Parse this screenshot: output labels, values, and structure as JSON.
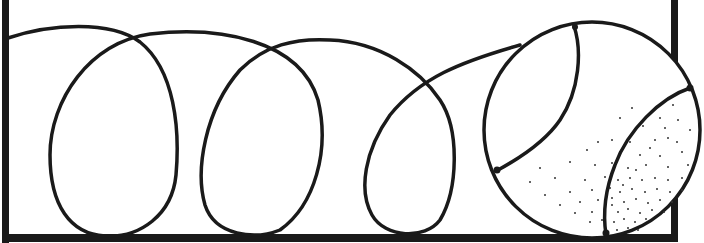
{
  "figure": {
    "description": "Line drawing of a looping line forming three loops that ends at a circle containing a curved seam and a stippled region, enclosed by a bracket-like frame",
    "colors": {
      "stroke": "#1a1a1a",
      "background": "#ffffff",
      "stipple": "#333333"
    },
    "elements": {
      "frame": "open-frame",
      "loops": 3,
      "ball": "circle-with-seams",
      "stipple": "dotted-shading"
    }
  }
}
